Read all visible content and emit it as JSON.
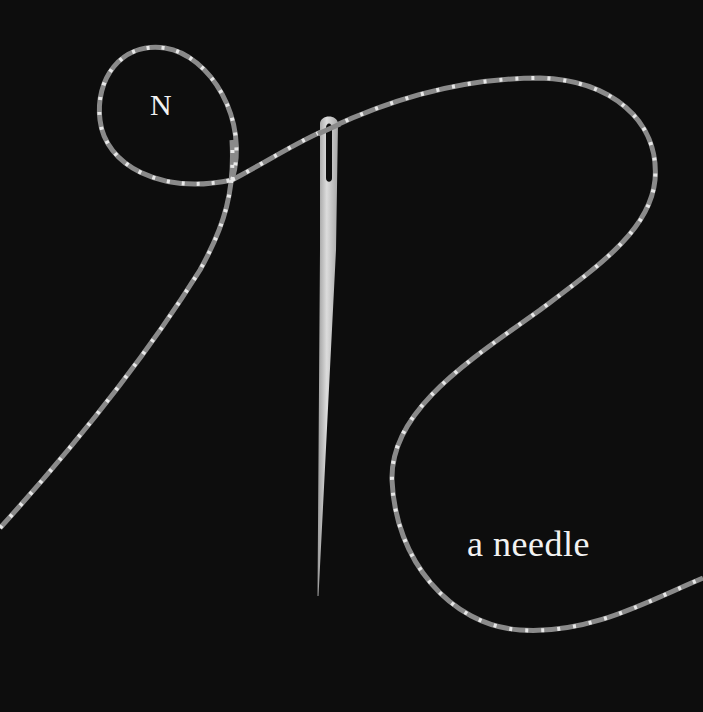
{
  "illustration": {
    "initial_letter": "N",
    "caption": "a needle",
    "subject": "threaded sewing needle with twisted thread",
    "colors": {
      "background": "#0d0d0d",
      "thread": "#8c8c8c",
      "thread_twist": "#e6e6e6",
      "needle": "#c8c8c8",
      "text": "#f2f2f2"
    }
  }
}
